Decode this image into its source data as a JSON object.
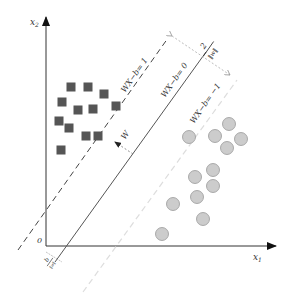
{
  "diagram": {
    "axes": {
      "x_label": "x",
      "x_sub": "1",
      "y_label": "x",
      "y_sub": "2",
      "origin_label": "0"
    },
    "lines": {
      "positive_margin": "WX−b= 1",
      "hyperplane": "WX−b= 0",
      "negative_margin": "WX−b= −1"
    },
    "normal_vector_label": "W",
    "margin_label_num": "2",
    "margin_label_den": "‖w‖",
    "offset_label_num": "b",
    "offset_label_den": "‖w‖",
    "class_a": {
      "shape": "square",
      "color": "#555555",
      "points": [
        [
          71,
          87
        ],
        [
          88,
          87
        ],
        [
          104,
          94
        ],
        [
          62,
          102
        ],
        [
          78,
          110
        ],
        [
          93,
          109
        ],
        [
          116,
          106
        ],
        [
          59,
          121
        ],
        [
          69,
          128
        ],
        [
          86,
          136
        ],
        [
          98,
          136
        ],
        [
          61,
          150
        ]
      ]
    },
    "class_b": {
      "shape": "circle",
      "color": "#cccccc",
      "stroke": "#999999",
      "points": [
        [
          189,
          137
        ],
        [
          215,
          136
        ],
        [
          229,
          124
        ],
        [
          241,
          139
        ],
        [
          227,
          148
        ],
        [
          213,
          170
        ],
        [
          195,
          177
        ],
        [
          213,
          186
        ],
        [
          197,
          197
        ],
        [
          173,
          204
        ],
        [
          203,
          219
        ],
        [
          162,
          234
        ]
      ]
    }
  }
}
